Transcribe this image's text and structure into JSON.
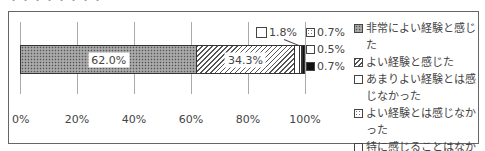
{
  "chart_data": {
    "type": "bar",
    "orientation": "horizontal-stacked-100",
    "title": "",
    "categories": [
      ""
    ],
    "series": [
      {
        "name": "非常によい経験と感じた",
        "values": [
          62.0
        ],
        "pattern": "crosshatch-dark",
        "label": "62.0%"
      },
      {
        "name": "よい経験と感じた",
        "values": [
          34.3
        ],
        "pattern": "diagonal",
        "label": "34.3%"
      },
      {
        "name": "あまりよい経験とは感じなかった",
        "values": [
          1.8
        ],
        "pattern": "white",
        "label": "1.8%"
      },
      {
        "name": "よい経験とは感じなかった",
        "values": [
          0.7
        ],
        "pattern": "dots",
        "label": "0.7%"
      },
      {
        "name": "特に感じることはなかった",
        "values": [
          0.5
        ],
        "pattern": "checker",
        "label": "0.5%"
      },
      {
        "name": "不明",
        "values": [
          0.7
        ],
        "pattern": "black",
        "label": "0.7%"
      }
    ],
    "xlabel": "",
    "ylabel": "",
    "xlim": [
      0,
      100
    ],
    "xticks": [
      "0%",
      "20%",
      "40%",
      "60%",
      "80%",
      "100%"
    ],
    "grid": true,
    "legend_position": "right"
  },
  "title_fragment": "・・・・・・・・",
  "legend": [
    {
      "label": "非常によい経験と感じた"
    },
    {
      "label": "よい経験と感じた"
    },
    {
      "label": "あまりよい経験とは感じなかった"
    },
    {
      "label": "よい経験とは感じなかった"
    },
    {
      "label": "特に感じることはなかった"
    },
    {
      "label": "不明"
    }
  ]
}
